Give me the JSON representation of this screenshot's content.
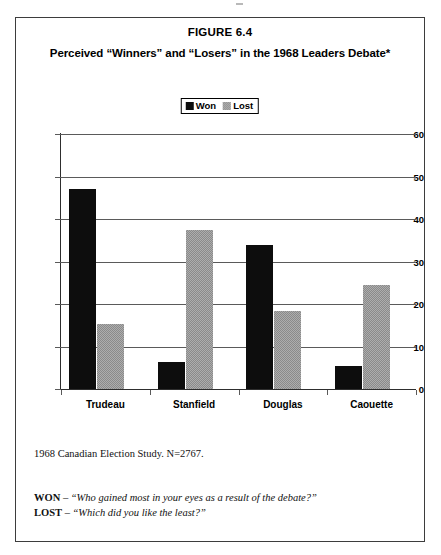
{
  "figure": {
    "number_label": "FIGURE 6.4",
    "subtitle": "Perceived “Winners” and “Losers” in the 1968 Leaders Debate*"
  },
  "legend": {
    "position": "top-center",
    "items": [
      {
        "label": "Won",
        "swatch": "solid-black-swatch",
        "color": "#0d0d0d"
      },
      {
        "label": "Lost",
        "swatch": "dithered-gray-swatch",
        "color": "#adadad"
      }
    ]
  },
  "notes": {
    "source": "1968 Canadian Election Study.  N=2767.",
    "won_key": "WON",
    "won_dash": " – ",
    "won_question": "“Who gained most in your eyes as a result of the debate?”",
    "lost_key": "LOST",
    "lost_dash": " – ",
    "lost_question": "“Which did you like the least?”"
  },
  "chart_data": {
    "type": "bar",
    "title": "Perceived “Winners” and “Losers” in the 1968 Leaders Debate*",
    "xlabel": "",
    "ylabel": "",
    "ylim": [
      0,
      60
    ],
    "yticks": [
      0,
      10,
      20,
      30,
      40,
      50,
      60
    ],
    "ytick_labels": [
      "0",
      "10",
      "20",
      "30",
      "40",
      "50",
      "60"
    ],
    "grid": "horizontal",
    "legend_position": "top-center",
    "categories": [
      "Trudeau",
      "Stanfield",
      "Douglas",
      "Caouette"
    ],
    "series": [
      {
        "name": "Won",
        "color": "#0d0d0d",
        "values": [
          47.0,
          6.3,
          34.0,
          5.5
        ]
      },
      {
        "name": "Lost",
        "color": "#adadad",
        "values": [
          15.3,
          37.3,
          18.3,
          24.5
        ]
      }
    ]
  }
}
